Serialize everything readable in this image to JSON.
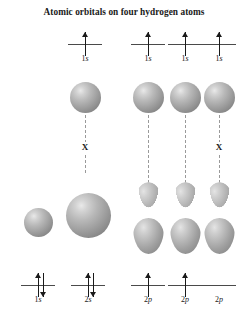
{
  "figure": {
    "title": "Atomic orbitals on four hydrogen atoms",
    "background_color": "#ffffff",
    "orbital_fill_color": "#a0a0a0",
    "line_color": "#4a4a4a",
    "dash_color": "#9a9a9a",
    "node_marker": "X"
  },
  "chart_data": {
    "type": "diagram",
    "title": "Atomic orbitals on four hydrogen atoms",
    "hydrogen_row": {
      "label": "Atomic orbitals on four hydrogen atoms",
      "count": 4,
      "orbitals": [
        {
          "label": "1s",
          "electrons": [
            "up"
          ],
          "sphere": "1s",
          "node_marker": "X"
        },
        {
          "label": "1s",
          "electrons": [
            "up"
          ],
          "sphere": "1s",
          "node_marker": ""
        },
        {
          "label": "1s",
          "electrons": [
            "up"
          ],
          "sphere": "1s",
          "node_marker": ""
        },
        {
          "label": "1s",
          "electrons": [
            "up"
          ],
          "sphere": "1s",
          "node_marker": "X"
        }
      ]
    },
    "central_atom_row": {
      "orbitals": [
        {
          "label": "1s",
          "shape": "sphere",
          "size": "small",
          "electrons": [
            "up",
            "down"
          ]
        },
        {
          "label": "2s",
          "shape": "sphere",
          "size": "large",
          "electrons": [
            "up",
            "down"
          ]
        },
        {
          "label": "2p",
          "shape": "dumbbell",
          "size": "p",
          "electrons": [
            "up"
          ]
        },
        {
          "label": "2p",
          "shape": "dumbbell",
          "size": "p",
          "electrons": [
            "up"
          ]
        },
        {
          "label": "2p",
          "shape": "dumbbell",
          "size": "p",
          "electrons": []
        }
      ]
    },
    "labels_top": [
      "1s",
      "1s",
      "1s",
      "1s"
    ],
    "labels_bottom": [
      "1s",
      "2s",
      "2p",
      "2p",
      "2p"
    ]
  }
}
